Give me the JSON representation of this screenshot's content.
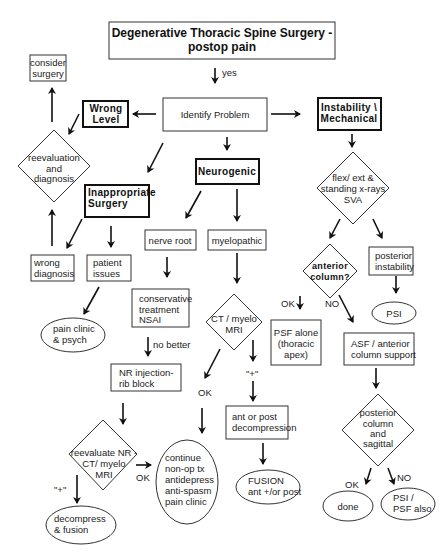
{
  "title": {
    "line1": "Degenerative Thoracic Spine Surgery -",
    "line2": "postop pain"
  },
  "edge_labels": {
    "yes": "yes",
    "no_better": "no better",
    "ok_ct": "OK",
    "plus_ct": "\"+\"",
    "ok_reeval": "OK",
    "plus_reeval": "\"+\"",
    "ok_anterior": "OK",
    "no_anterior": "NO",
    "ok_posterior": "OK",
    "no_posterior": "NO"
  },
  "nodes": {
    "identify_problem": "Identify Problem",
    "wrong_level": {
      "line1": "Wrong",
      "line2": "Level"
    },
    "consider_surgery": {
      "line1": "consider",
      "line2": "surgery"
    },
    "reevaluation": {
      "line1": "reevaluation",
      "line2": "and",
      "line3": "diagnosis"
    },
    "inappropriate_surgery": {
      "line1": "Inappropriate",
      "line2": "Surgery"
    },
    "wrong_diagnosis": {
      "line1": "wrong",
      "line2": "diagnosis"
    },
    "patient_issues": {
      "line1": "patient",
      "line2": "issues"
    },
    "pain_clinic_psych": {
      "line1": "pain clinic",
      "line2": "& psych"
    },
    "neurogenic": "Neurogenic",
    "nerve_root": "nerve root",
    "myelopathic": "myelopathic",
    "conservative": {
      "line1": "conservative",
      "line2": "treatment",
      "line3": "NSAI"
    },
    "nr_injection": {
      "line1": "NR  injection-",
      "line2": "rib block"
    },
    "reevaluate_nr": {
      "line1": "reevaluate NR -",
      "line2": "CT/ myelo",
      "line3": "MRI"
    },
    "decompress_fusion": {
      "line1": "decompress",
      "line2": "& fusion"
    },
    "continue_nonop": {
      "line1": "continue",
      "line2": "non-op tx",
      "line3": "antidepress",
      "line4": "anti-spasm",
      "line5": "pain clinic"
    },
    "ct_myelo_mri": {
      "line1": "CT / myelo",
      "line2": "MRI"
    },
    "ant_post_decompression": {
      "line1": "ant or post",
      "line2": "decompression"
    },
    "fusion": {
      "line1": "FUSION",
      "line2": "ant +/or  post"
    },
    "instability": {
      "line1": "Instability \\",
      "line2": "Mechanical"
    },
    "flex_ext": {
      "line1": "flex/ ext  &",
      "line2": "standing x-rays",
      "line3": "SVA"
    },
    "anterior_column": {
      "line1": "anterior",
      "line2": "column?"
    },
    "posterior_instability": {
      "line1": "posterior",
      "line2": "instability"
    },
    "psi": "PSI",
    "psf_alone": {
      "line1": "PSF alone",
      "line2": "(thoracic",
      "line3": "apex)"
    },
    "asf_anterior": {
      "line1": "ASF / anterior",
      "line2": "column support"
    },
    "posterior_sagittal": {
      "line1": "posterior",
      "line2": "column",
      "line3": "and",
      "line4": "sagittal"
    },
    "done": "done",
    "psi_psf_also": {
      "line1": "PSI /",
      "line2": "PSF also"
    }
  }
}
